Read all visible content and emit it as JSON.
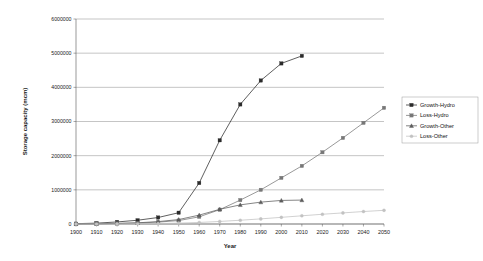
{
  "chart_data": {
    "type": "line",
    "title": "",
    "xlabel": "Year",
    "ylabel": "Storage capacity (mcm)",
    "xlim": [
      1900,
      2050
    ],
    "ylim": [
      0,
      6000000
    ],
    "grid": true,
    "legend_position": "right",
    "x": [
      1900,
      1910,
      1920,
      1930,
      1940,
      1950,
      1960,
      1970,
      1980,
      1990,
      2000,
      2010,
      2020,
      2030,
      2040,
      2050
    ],
    "xticks": [
      "1900",
      "1910",
      "1920",
      "1930",
      "1940",
      "1950",
      "1960",
      "1970",
      "1980",
      "1990",
      "2000",
      "2010",
      "2020",
      "2030",
      "2040",
      "2050"
    ],
    "yticks": [
      "0",
      "1000000",
      "2000000",
      "3000000",
      "4000000",
      "5000000",
      "6000000"
    ],
    "series": [
      {
        "name": "Growth-Hydro",
        "color": "#2b2b2b",
        "marker": "square-filled",
        "values": [
          10000,
          25000,
          60000,
          110000,
          190000,
          330000,
          1200000,
          2450000,
          3500000,
          4200000,
          4700000,
          4920000,
          null,
          null,
          null,
          null
        ]
      },
      {
        "name": "Loss-Hydro",
        "color": "#777777",
        "marker": "square",
        "values": [
          2000,
          6000,
          14000,
          28000,
          55000,
          100000,
          210000,
          420000,
          700000,
          1000000,
          1350000,
          1700000,
          2100000,
          2520000,
          2960000,
          3400000
        ]
      },
      {
        "name": "Growth-Other",
        "color": "#5c5c5c",
        "marker": "triangle",
        "values": [
          3000,
          8000,
          18000,
          35000,
          70000,
          130000,
          260000,
          430000,
          560000,
          640000,
          690000,
          700000,
          null,
          null,
          null,
          null
        ]
      },
      {
        "name": "Loss-Other",
        "color": "#c2c2c2",
        "marker": "circle",
        "values": [
          500,
          1500,
          3500,
          7000,
          14000,
          26000,
          45000,
          75000,
          110000,
          150000,
          195000,
          240000,
          285000,
          325000,
          365000,
          400000
        ]
      }
    ]
  },
  "legend": {
    "items": [
      {
        "label": "Growth-Hydro"
      },
      {
        "label": "Loss-Hydro"
      },
      {
        "label": "Growth-Other"
      },
      {
        "label": "Loss-Other"
      }
    ]
  }
}
